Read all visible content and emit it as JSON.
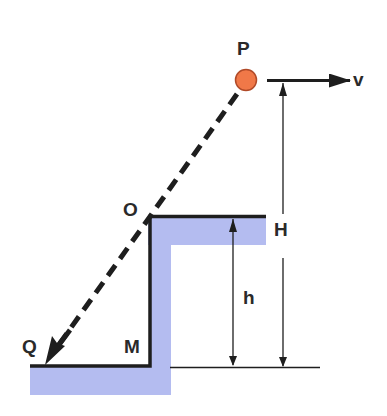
{
  "diagram": {
    "type": "projectile-off-cliff",
    "labels": {
      "P": "P",
      "v": "v",
      "O": "O",
      "H": "H",
      "h": "h",
      "Q": "Q",
      "M": "M"
    },
    "colors": {
      "ball": "#f07848",
      "ball_stroke": "#b04a28",
      "ground_fill": "#b4bcf0",
      "line": "#1e1e1e"
    }
  }
}
